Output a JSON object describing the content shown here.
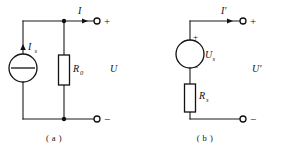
{
  "figure": {
    "title": "",
    "background_color": "#ffffff",
    "line_color": "#111111"
  },
  "circuits": [
    {
      "id": "a",
      "caption": "( a )",
      "type": "norton-equivalent-source",
      "source": {
        "kind": "current-source",
        "symbol": "circle-with-horizontal-bar",
        "label": "I",
        "label_subscript": "s",
        "arrow_direction": "up"
      },
      "resistor": {
        "label": "R",
        "label_subscript": "0",
        "orientation": "vertical"
      },
      "port_current": {
        "label": "I",
        "label_subscript": "",
        "arrow_direction": "right"
      },
      "port_voltage": {
        "label": "U",
        "label_subscript": ""
      },
      "terminals": {
        "top_sign": "+",
        "bottom_sign": "−"
      }
    },
    {
      "id": "b",
      "caption": "( b )",
      "type": "thevenin-equivalent-source",
      "source": {
        "kind": "voltage-source",
        "symbol": "empty-circle",
        "label": "U",
        "label_subscript": "s",
        "plus_sign": "+",
        "minus_sign": "−"
      },
      "resistor": {
        "label": "R",
        "label_subscript": "s",
        "orientation": "vertical"
      },
      "port_current": {
        "label": "I′",
        "label_subscript": "",
        "arrow_direction": "right"
      },
      "port_voltage": {
        "label": "U′",
        "label_subscript": ""
      },
      "terminals": {
        "top_sign": "+",
        "bottom_sign": "−"
      }
    }
  ]
}
